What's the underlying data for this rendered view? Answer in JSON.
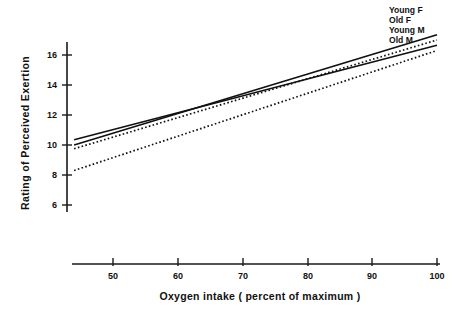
{
  "chart_data": {
    "type": "line",
    "title": "",
    "xlabel": "Oxygen intake ( percent of maximum )",
    "ylabel": "Rating of Perceived Exertion",
    "xlim": [
      44,
      100
    ],
    "ylim": [
      5,
      17.6
    ],
    "grid": false,
    "legend_position": "right-inline-end-of-line",
    "x_ticks": [
      50,
      60,
      70,
      80,
      90,
      100
    ],
    "x_tick_labels": [
      "50",
      "60",
      "70",
      "80",
      "90",
      "100"
    ],
    "y_ticks": [
      6,
      8,
      10,
      12,
      14,
      16
    ],
    "y_tick_labels": [
      "6",
      "8",
      "10",
      "12",
      "14",
      "16"
    ],
    "x": [
      44,
      100
    ],
    "series": [
      {
        "name": "Young F",
        "style": "solid",
        "values": [
          10.0,
          17.35
        ],
        "endpoints": {
          "x_start": 44,
          "y_start": 10.0,
          "x_end": 100,
          "y_end": 17.35
        }
      },
      {
        "name": "Old F",
        "style": "dotted",
        "values": [
          9.75,
          17.0
        ],
        "endpoints": {
          "x_start": 44,
          "y_start": 9.75,
          "x_end": 100,
          "y_end": 17.0
        }
      },
      {
        "name": "Young M",
        "style": "solid",
        "values": [
          10.35,
          16.65
        ],
        "endpoints": {
          "x_start": 44,
          "y_start": 10.35,
          "x_end": 100,
          "y_end": 16.65
        }
      },
      {
        "name": "Old M",
        "style": "dotted",
        "values": [
          8.3,
          16.3
        ],
        "endpoints": {
          "x_start": 44,
          "y_start": 8.3,
          "x_end": 100,
          "y_end": 16.3
        }
      }
    ]
  },
  "axes": {
    "y_title": "Rating of Perceived Exertion",
    "x_title": "Oxygen intake ( percent of maximum )"
  },
  "legend": {
    "items": [
      {
        "label": "Young F"
      },
      {
        "label": "Old F"
      },
      {
        "label": "Young M"
      },
      {
        "label": "Old M"
      }
    ]
  }
}
